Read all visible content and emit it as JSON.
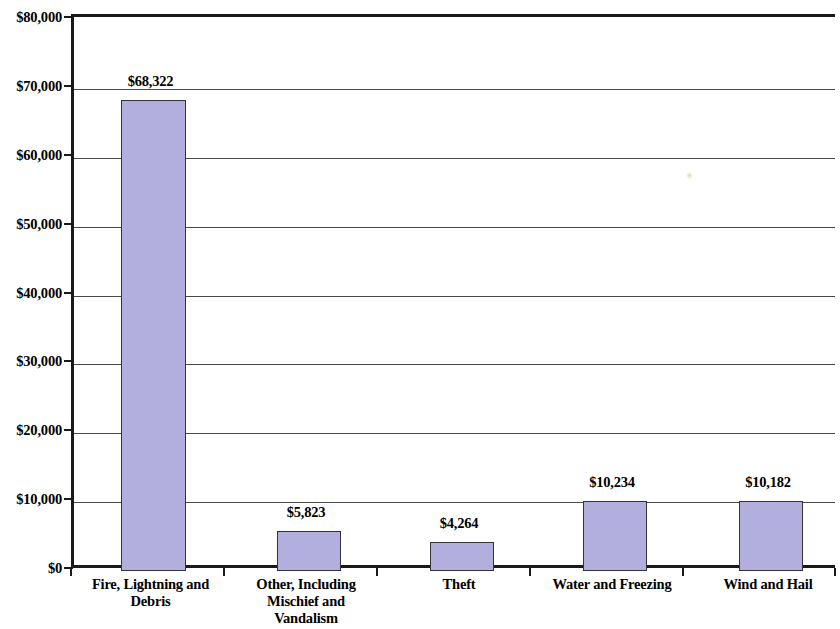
{
  "chart_data": {
    "type": "bar",
    "title": "",
    "subtitle": "",
    "xlabel": "",
    "ylabel": "",
    "ylim": [
      0,
      80000
    ],
    "ytick_step": 10000,
    "grid": true,
    "legend": "none",
    "bar_color": "#b2afdf",
    "bar_border_color": "#33333a",
    "axis_color": "#1a1a1a",
    "categories": [
      "Fire, Lightning and Debris",
      "Other, Including Mischief and Vandalism",
      "Theft",
      "Water and Freezing",
      "Wind and Hail"
    ],
    "category_lines": [
      [
        "Fire, Lightning and",
        "Debris"
      ],
      [
        "Other, Including",
        "Mischief and",
        "Vandalism"
      ],
      [
        "Theft"
      ],
      [
        "Water and Freezing"
      ],
      [
        "Wind and Hail"
      ]
    ],
    "values": [
      68322,
      5823,
      4264,
      10234,
      10182
    ],
    "value_labels": [
      "$68,322",
      "$5,823",
      "$4,264",
      "$10,234",
      "$10,182"
    ],
    "ytick_labels": [
      "$80,000",
      "$70,000",
      "$60,000",
      "$50,000",
      "$40,000",
      "$30,000",
      "$20,000",
      "$10,000",
      "$0"
    ],
    "ytick_values": [
      80000,
      70000,
      60000,
      50000,
      40000,
      30000,
      20000,
      10000,
      0
    ]
  }
}
